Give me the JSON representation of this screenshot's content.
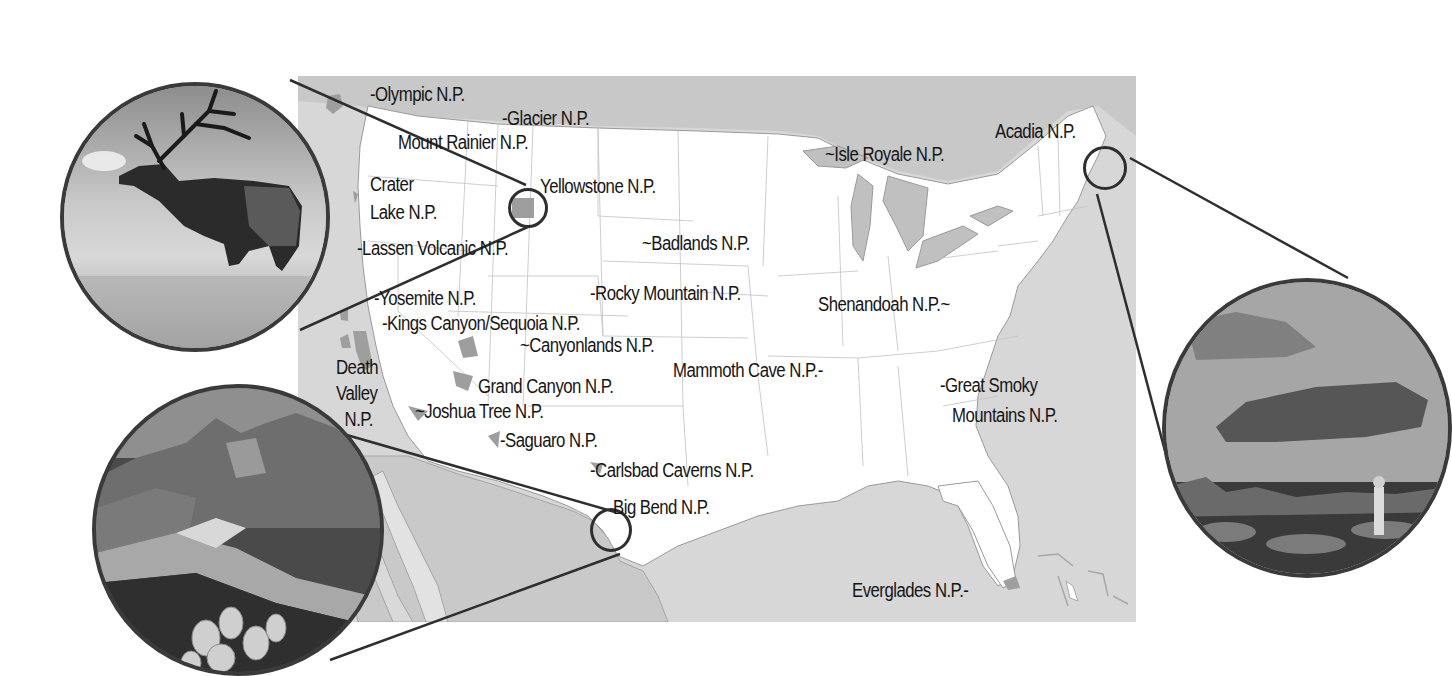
{
  "map": {
    "title": "National Parks of the United States",
    "colors": {
      "water": "#d7d7d7",
      "us_land": "#ffffff",
      "mexico_land": "#c9c9c9",
      "park_fill": "#9e9e9e",
      "borders": "#b4b4b4",
      "outline": "#2e2e2e",
      "text": "#151515"
    },
    "parks": [
      {
        "id": "olympic",
        "lines": [
          "Olympic N.P."
        ]
      },
      {
        "id": "glacier",
        "lines": [
          "Glacier N.P."
        ]
      },
      {
        "id": "mount-rainier",
        "lines": [
          "Mount Rainier N.P."
        ]
      },
      {
        "id": "crater-lake",
        "lines": [
          "Crater",
          "Lake N.P."
        ]
      },
      {
        "id": "yellowstone",
        "lines": [
          "Yellowstone N.P."
        ]
      },
      {
        "id": "lassen-volcanic",
        "lines": [
          "Lassen Volcanic N.P."
        ]
      },
      {
        "id": "badlands",
        "lines": [
          "Badlands N.P."
        ]
      },
      {
        "id": "isle-royale",
        "lines": [
          "Isle Royale N.P."
        ]
      },
      {
        "id": "acadia",
        "lines": [
          "Acadia N.P."
        ]
      },
      {
        "id": "yosemite",
        "lines": [
          "Yosemite N.P."
        ]
      },
      {
        "id": "rocky-mountain",
        "lines": [
          "Rocky Mountain N.P."
        ]
      },
      {
        "id": "shenandoah",
        "lines": [
          "Shenandoah N.P."
        ]
      },
      {
        "id": "kings-canyon-sequoia",
        "lines": [
          "Kings Canyon/Sequoia N.P."
        ]
      },
      {
        "id": "canyonlands",
        "lines": [
          "Canyonlands N.P."
        ]
      },
      {
        "id": "death-valley",
        "lines": [
          "Death",
          "Valley",
          "N.P."
        ]
      },
      {
        "id": "grand-canyon",
        "lines": [
          "Grand Canyon N.P."
        ]
      },
      {
        "id": "mammoth-cave",
        "lines": [
          "Mammoth Cave N.P."
        ]
      },
      {
        "id": "great-smoky-mountains",
        "lines": [
          "Great Smoky",
          "Mountains N.P."
        ]
      },
      {
        "id": "joshua-tree",
        "lines": [
          "Joshua Tree N.P."
        ]
      },
      {
        "id": "saguaro",
        "lines": [
          "Saguaro N.P."
        ]
      },
      {
        "id": "carlsbad-caverns",
        "lines": [
          "Carlsbad Caverns N.P."
        ]
      },
      {
        "id": "big-bend",
        "lines": [
          "Big Bend N.P."
        ]
      },
      {
        "id": "everglades",
        "lines": [
          "Everglades N.P."
        ]
      }
    ]
  },
  "photos": [
    {
      "id": "elk-photo",
      "subject": "bull elk bugling in grassland",
      "links_to": "Yellowstone N.P."
    },
    {
      "id": "canyon-photo",
      "subject": "desert river canyon with prickly pear cactus",
      "links_to": "Big Bend N.P."
    },
    {
      "id": "coast-photo",
      "subject": "hiker on rocky coast overlooking foggy islands",
      "links_to": "Acadia N.P."
    }
  ]
}
